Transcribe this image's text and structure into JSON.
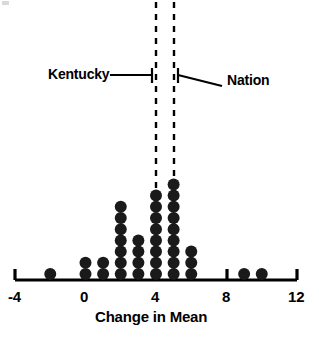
{
  "chart_data": {
    "type": "scatter",
    "plot_style": "dotplot",
    "title": "",
    "xlabel": "Change in Mean",
    "ylabel": "",
    "xlim": [
      -4,
      12
    ],
    "xticks": [
      -4,
      0,
      4,
      8,
      12
    ],
    "xtick_labels": [
      "-4",
      "0",
      "4",
      "8",
      "12"
    ],
    "grid": false,
    "legend": "none",
    "categories": [
      -2,
      0,
      1,
      2,
      3,
      4,
      5,
      6,
      9,
      10
    ],
    "values": [
      1,
      2,
      2,
      7,
      4,
      8,
      9,
      3,
      1,
      1
    ],
    "total_points": 38,
    "annotations": [
      {
        "label": "Kentucky",
        "x_value": 4.0,
        "style": "dashed-vertical-line-with-leader"
      },
      {
        "label": "Nation",
        "x_value": 5.0,
        "style": "dashed-vertical-line-with-leader"
      }
    ],
    "dot_color": "#1a1a1a",
    "axis_color": "#000000"
  },
  "axis": {
    "xlabel": "Change in Mean",
    "ticks": [
      "-4",
      "0",
      "4",
      "8",
      "12"
    ]
  },
  "annotations": {
    "kentucky_label": "Kentucky",
    "nation_label": "Nation"
  }
}
